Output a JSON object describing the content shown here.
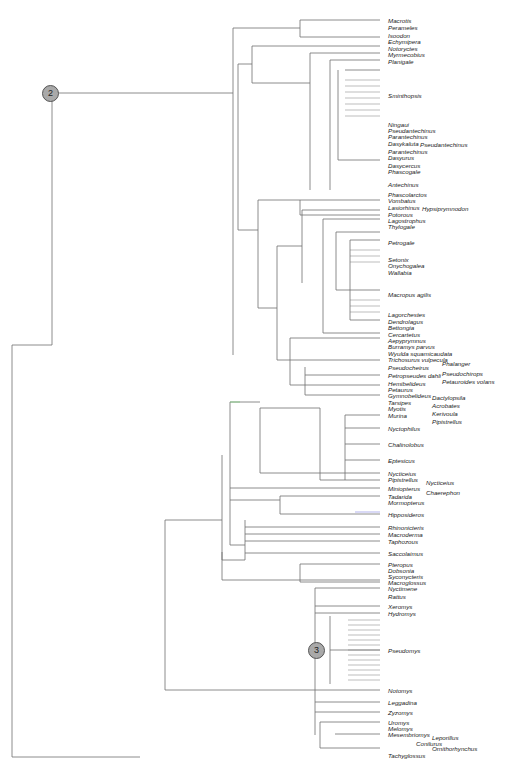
{
  "figure": {
    "type": "phylogenetic-tree",
    "node_markers": [
      {
        "label": "2",
        "x": 50,
        "y": 93
      },
      {
        "label": "3",
        "x": 316,
        "y": 650
      }
    ]
  },
  "taxa": [
    {
      "name": "Macrotis",
      "x": 388,
      "y": 20
    },
    {
      "name": "Perameles",
      "x": 388,
      "y": 27
    },
    {
      "name": "Isoodon",
      "x": 388,
      "y": 35
    },
    {
      "name": "Echymipera",
      "x": 388,
      "y": 41
    },
    {
      "name": "Notoryctes",
      "x": 388,
      "y": 48
    },
    {
      "name": "Myrmecobius",
      "x": 388,
      "y": 54
    },
    {
      "name": "Planigale",
      "x": 388,
      "y": 61
    },
    {
      "name": "Sminthopsis",
      "x": 388,
      "y": 95
    },
    {
      "name": "Ningaui",
      "x": 388,
      "y": 124
    },
    {
      "name": "Pseudantechinus",
      "x": 388,
      "y": 130
    },
    {
      "name": "Parantechinus",
      "x": 388,
      "y": 136
    },
    {
      "name": "Dasykaluta",
      "x": 388,
      "y": 143
    },
    {
      "name": "Pseudantechinus",
      "x": 420,
      "y": 144
    },
    {
      "name": "Parantechinus",
      "x": 388,
      "y": 151
    },
    {
      "name": "Dasyurus",
      "x": 388,
      "y": 157
    },
    {
      "name": "Dasycercus",
      "x": 388,
      "y": 165
    },
    {
      "name": "Phascogale",
      "x": 388,
      "y": 171
    },
    {
      "name": "Antechinus",
      "x": 388,
      "y": 184
    },
    {
      "name": "Phascolarctos",
      "x": 388,
      "y": 194
    },
    {
      "name": "Vombatus",
      "x": 388,
      "y": 200
    },
    {
      "name": "Lasiorhinus",
      "x": 388,
      "y": 207
    },
    {
      "name": "Hypsiprymnodon",
      "x": 422,
      "y": 208
    },
    {
      "name": "Potorous",
      "x": 388,
      "y": 214
    },
    {
      "name": "Lagostrophus",
      "x": 388,
      "y": 220
    },
    {
      "name": "Thylogale",
      "x": 388,
      "y": 226
    },
    {
      "name": "Petrogale",
      "x": 388,
      "y": 242
    },
    {
      "name": "Setonix",
      "x": 388,
      "y": 259
    },
    {
      "name": "Onychogalea",
      "x": 388,
      "y": 265
    },
    {
      "name": "Wallabia",
      "x": 388,
      "y": 272
    },
    {
      "name": "Macropus agilis",
      "x": 388,
      "y": 294
    },
    {
      "name": "Lagorchestes",
      "x": 388,
      "y": 314
    },
    {
      "name": "Dendrolagus",
      "x": 388,
      "y": 321
    },
    {
      "name": "Bettongia",
      "x": 388,
      "y": 327
    },
    {
      "name": "Cercartetus",
      "x": 388,
      "y": 334
    },
    {
      "name": "Aepyprymnus",
      "x": 388,
      "y": 340
    },
    {
      "name": "Burramys parvus",
      "x": 388,
      "y": 346
    },
    {
      "name": "Wyulda squamicaudata",
      "x": 388,
      "y": 353
    },
    {
      "name": "Trichosurus vulpecula",
      "x": 388,
      "y": 359
    },
    {
      "name": "Phalanger",
      "x": 442,
      "y": 363
    },
    {
      "name": "Pseudocheirus",
      "x": 388,
      "y": 367
    },
    {
      "name": "Pseudochirops",
      "x": 442,
      "y": 373
    },
    {
      "name": "Petropseudes dahli",
      "x": 388,
      "y": 375
    },
    {
      "name": "Petauroides volans",
      "x": 442,
      "y": 381
    },
    {
      "name": "Hemibelideus",
      "x": 388,
      "y": 383
    },
    {
      "name": "Petaurus",
      "x": 388,
      "y": 389
    },
    {
      "name": "Gymnobelideus",
      "x": 388,
      "y": 395
    },
    {
      "name": "Dactylopsila",
      "x": 432,
      "y": 397
    },
    {
      "name": "Tarsipes",
      "x": 388,
      "y": 402
    },
    {
      "name": "Acrobates",
      "x": 432,
      "y": 405
    },
    {
      "name": "Myotis",
      "x": 388,
      "y": 408
    },
    {
      "name": "Kerivoula",
      "x": 432,
      "y": 413
    },
    {
      "name": "Murina",
      "x": 388,
      "y": 415
    },
    {
      "name": "Pipistrellus",
      "x": 432,
      "y": 421
    },
    {
      "name": "Nyctophilus",
      "x": 388,
      "y": 428
    },
    {
      "name": "Chalinolobus",
      "x": 388,
      "y": 444
    },
    {
      "name": "Eptesicus",
      "x": 388,
      "y": 460
    },
    {
      "name": "Nycticeius",
      "x": 388,
      "y": 473
    },
    {
      "name": "Pipistrellus",
      "x": 388,
      "y": 479
    },
    {
      "name": "Nycticeius",
      "x": 426,
      "y": 482
    },
    {
      "name": "Miniopterus",
      "x": 388,
      "y": 488
    },
    {
      "name": "Chaerephon",
      "x": 426,
      "y": 492
    },
    {
      "name": "Tadarida",
      "x": 388,
      "y": 496
    },
    {
      "name": "Mormopterus",
      "x": 388,
      "y": 502
    },
    {
      "name": "Hipposideros",
      "x": 388,
      "y": 514
    },
    {
      "name": "Rhinonicteris",
      "x": 388,
      "y": 527
    },
    {
      "name": "Macroderma",
      "x": 388,
      "y": 534
    },
    {
      "name": "Taphozous",
      "x": 388,
      "y": 541
    },
    {
      "name": "Saccolaimus",
      "x": 388,
      "y": 553
    },
    {
      "name": "Pteropus",
      "x": 388,
      "y": 564
    },
    {
      "name": "Dobsonia",
      "x": 388,
      "y": 570
    },
    {
      "name": "Syconycteris",
      "x": 388,
      "y": 576
    },
    {
      "name": "Macroglossus",
      "x": 388,
      "y": 582
    },
    {
      "name": "Nyctimene",
      "x": 388,
      "y": 588
    },
    {
      "name": "Rattus",
      "x": 388,
      "y": 596
    },
    {
      "name": "Xeromys",
      "x": 388,
      "y": 606
    },
    {
      "name": "Hydromys",
      "x": 388,
      "y": 613
    },
    {
      "name": "Pseudomys",
      "x": 388,
      "y": 650
    },
    {
      "name": "Notomys",
      "x": 388,
      "y": 690
    },
    {
      "name": "Leggadina",
      "x": 388,
      "y": 702
    },
    {
      "name": "Zyzomys",
      "x": 388,
      "y": 712
    },
    {
      "name": "Uromys",
      "x": 388,
      "y": 722
    },
    {
      "name": "Melomys",
      "x": 388,
      "y": 728
    },
    {
      "name": "Mesembriomys",
      "x": 388,
      "y": 734
    },
    {
      "name": "Leporillus",
      "x": 432,
      "y": 737
    },
    {
      "name": "Conilurus",
      "x": 416,
      "y": 743
    },
    {
      "name": "Ornithorhynchus",
      "x": 432,
      "y": 748
    },
    {
      "name": "Tachyglossus",
      "x": 388,
      "y": 755
    }
  ],
  "colors": {
    "line": "#6e6e6e",
    "node_fill": "#a9a9a9",
    "accent_green": "#7fd07f",
    "accent_blue": "#8080e0"
  }
}
